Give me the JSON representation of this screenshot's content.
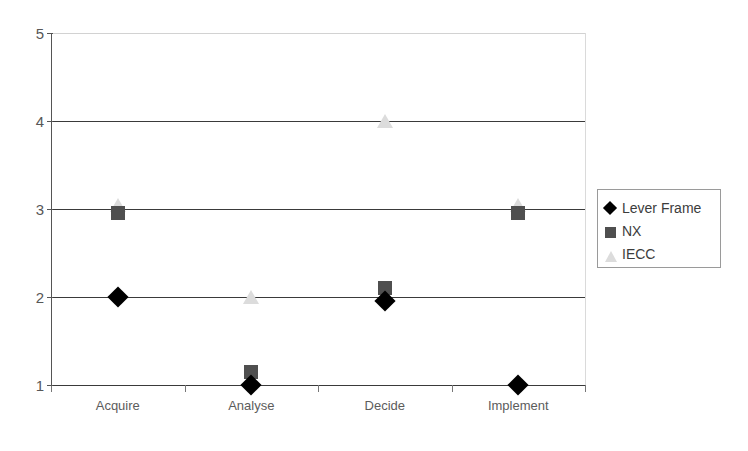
{
  "chart_data": {
    "type": "scatter",
    "title": "",
    "subtitle": "",
    "xlabel": "",
    "ylabel": "",
    "categories": [
      "Acquire",
      "Analyse",
      "Decide",
      "Implement"
    ],
    "ylim": [
      1,
      5
    ],
    "y_ticks": [
      "1",
      "2",
      "3",
      "4",
      "5"
    ],
    "grid": true,
    "grid_axis": "y",
    "legend_position": "right",
    "series": [
      {
        "name": "Lever Frame",
        "marker": "diamond",
        "color": "#000000",
        "values": [
          2,
          1,
          1.95,
          1
        ]
      },
      {
        "name": "NX",
        "marker": "square",
        "color": "#4f4f4f",
        "values": [
          2.95,
          1.15,
          2.1,
          2.95
        ]
      },
      {
        "name": "IECC",
        "marker": "triangle",
        "color": "#dcdcdc",
        "values": [
          3.05,
          2,
          4,
          3.05
        ]
      }
    ]
  },
  "axes": {
    "y_tick_labels": [
      "5",
      "4",
      "3",
      "2",
      "1"
    ],
    "x_tick_labels": [
      "Acquire",
      "Analyse",
      "Decide",
      "Implement"
    ]
  },
  "legend": {
    "entries": [
      {
        "label": "Lever Frame",
        "marker": "diamond-icon"
      },
      {
        "label": "NX",
        "marker": "square-icon"
      },
      {
        "label": "IECC",
        "marker": "triangle-icon"
      }
    ]
  }
}
